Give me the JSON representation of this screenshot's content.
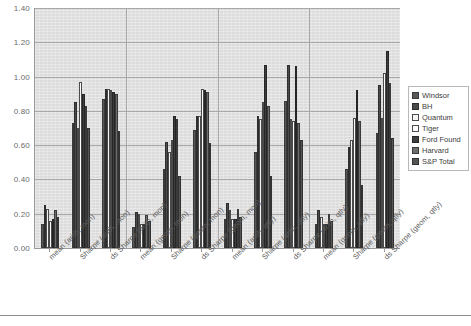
{
  "chart_data": {
    "type": "bar",
    "title": "",
    "subtitle": "",
    "xlabel": "",
    "ylabel": "",
    "ylim": [
      0.0,
      1.4
    ],
    "ytick_labels": [
      "0.00",
      "0.20",
      "0.40",
      "0.60",
      "0.80",
      "1.00",
      "1.20",
      "1.40"
    ],
    "ytick_values": [
      0.0,
      0.2,
      0.4,
      0.6,
      0.8,
      1.0,
      1.2,
      1.4
    ],
    "grid": true,
    "legend_position": "right",
    "plot_background": "#dcdcdc",
    "axis_color": "#9a9a9a",
    "gridline_color": "#a8a8a8",
    "categories": [
      "mean (arith, mon)",
      "Sharpe (arith, mon)",
      "ds Sharpe (arith, mon)",
      "mean (geom, mon)",
      "Sharpe (geom, mon)",
      "ds Sharpe (geom, mon)",
      "mean (arith, qtly)",
      "Sharpe (arith, qtly)",
      "ds Sharpe (arith, qtly)",
      "mean (geom, qtly)",
      "Sharpe (geom, qtly)",
      "ds Sharpe (geom, qtly)"
    ],
    "group_separators_after": [
      2,
      5,
      8
    ],
    "series": [
      {
        "name": "Windsor",
        "color": "#585858",
        "values": [
          0.14,
          0.73,
          0.87,
          0.12,
          0.46,
          0.69,
          0.17,
          0.56,
          0.86,
          0.14,
          0.46,
          0.67
        ]
      },
      {
        "name": "BH",
        "color": "#4a4a4a",
        "values": [
          0.25,
          0.85,
          0.93,
          0.21,
          0.62,
          0.77,
          0.26,
          0.77,
          1.07,
          0.22,
          0.59,
          0.95
        ]
      },
      {
        "name": "Quantum",
        "color": "#f4f4f4",
        "values": [
          0.23,
          0.7,
          0.93,
          0.2,
          0.56,
          0.77,
          0.22,
          0.75,
          0.75,
          0.18,
          0.63,
          0.76
        ]
      },
      {
        "name": "Tiger",
        "color": "#fbfbfb",
        "values": [
          0.16,
          0.97,
          0.92,
          0.14,
          0.63,
          0.93,
          0.17,
          0.85,
          0.74,
          0.14,
          0.76,
          1.02
        ]
      },
      {
        "name": "Ford Found",
        "color": "#3d3d3d",
        "values": [
          0.17,
          0.9,
          0.91,
          0.14,
          0.77,
          0.92,
          0.17,
          1.07,
          1.06,
          0.14,
          0.92,
          1.15
        ]
      },
      {
        "name": "Harvard",
        "color": "#6d6d6d",
        "values": [
          0.22,
          0.83,
          0.9,
          0.19,
          0.75,
          0.91,
          0.23,
          0.83,
          0.73,
          0.2,
          0.74,
          0.96
        ]
      },
      {
        "name": "S&P Total",
        "color": "#555555",
        "values": [
          0.18,
          0.7,
          0.68,
          0.16,
          0.42,
          0.61,
          0.18,
          0.42,
          0.63,
          0.16,
          0.37,
          0.64
        ]
      }
    ]
  },
  "legend": {
    "items": [
      {
        "label": "Windsor"
      },
      {
        "label": "BH"
      },
      {
        "label": "Quantum"
      },
      {
        "label": "Tiger"
      },
      {
        "label": "Ford Found"
      },
      {
        "label": "Harvard"
      },
      {
        "label": "S&P Total"
      }
    ]
  }
}
